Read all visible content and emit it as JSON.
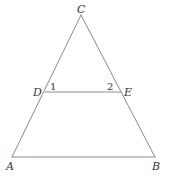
{
  "diagram": {
    "type": "triangle-with-parallel-segment",
    "colors": {
      "line": "#7d8f96",
      "text": "#333333",
      "background": "#ffffff"
    },
    "points": {
      "A": {
        "x": 12,
        "y": 157
      },
      "B": {
        "x": 155,
        "y": 157
      },
      "C": {
        "x": 81,
        "y": 15
      },
      "D": {
        "x": 45,
        "y": 92
      },
      "E": {
        "x": 121,
        "y": 92
      }
    },
    "segments": [
      {
        "name": "AC",
        "from": "A",
        "to": "C"
      },
      {
        "name": "BC",
        "from": "B",
        "to": "C"
      },
      {
        "name": "AB",
        "from": "A",
        "to": "B"
      },
      {
        "name": "DE",
        "from": "D",
        "to": "E"
      }
    ],
    "labels": {
      "A": "A",
      "B": "B",
      "C": "C",
      "D": "D",
      "E": "E"
    },
    "angle_labels": {
      "angle1": "1",
      "angle2": "2"
    }
  }
}
